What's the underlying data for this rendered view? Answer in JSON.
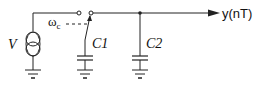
{
  "diagram": {
    "type": "circuit-schematic",
    "components": {
      "source": {
        "label": "V",
        "kind": "current-source"
      },
      "switch": {
        "control_label": "ω",
        "control_subscript": "c"
      },
      "cap1": {
        "label": "C1"
      },
      "cap2": {
        "label": "C2"
      },
      "output": {
        "label": "y(nT)"
      }
    }
  }
}
